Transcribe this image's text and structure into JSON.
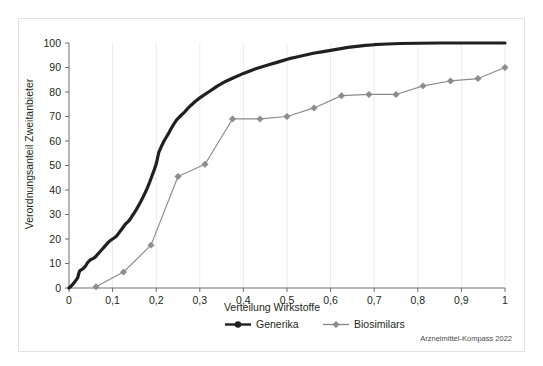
{
  "chart_data": {
    "type": "line",
    "title": "",
    "xlabel": "Verteilung Wirkstoffe",
    "ylabel": "Verordnungsanteil Zweitanbieter",
    "xlim": [
      0,
      1
    ],
    "ylim": [
      0,
      100
    ],
    "grid": true,
    "legend_position": "bottom",
    "credit": "Arzneimittel-Kompass 2022",
    "x_tick_labels": [
      "0",
      "0,1",
      "0,2",
      "0,3",
      "0,4",
      "0,5",
      "0,6",
      "0,7",
      "0,8",
      "0,9",
      "1"
    ],
    "x_tick_values": [
      0,
      0.1,
      0.2,
      0.3,
      0.4,
      0.5,
      0.6,
      0.7,
      0.8,
      0.9,
      1
    ],
    "y_tick_labels": [
      "0",
      "10",
      "20",
      "30",
      "40",
      "50",
      "60",
      "70",
      "80",
      "90",
      "100"
    ],
    "y_tick_values": [
      0,
      10,
      20,
      30,
      40,
      50,
      60,
      70,
      80,
      90,
      100
    ],
    "series": [
      {
        "name": "Generika",
        "color": "#231f20",
        "marker": "circle",
        "show_markers": false,
        "points": [
          [
            0.0,
            0.0
          ],
          [
            0.004,
            0.6
          ],
          [
            0.008,
            1.4
          ],
          [
            0.012,
            2.2
          ],
          [
            0.016,
            3.2
          ],
          [
            0.02,
            4.2
          ],
          [
            0.022,
            5.6
          ],
          [
            0.024,
            6.8
          ],
          [
            0.026,
            7.2
          ],
          [
            0.03,
            7.6
          ],
          [
            0.034,
            8.2
          ],
          [
            0.038,
            9.0
          ],
          [
            0.042,
            10.2
          ],
          [
            0.046,
            11.0
          ],
          [
            0.05,
            11.6
          ],
          [
            0.055,
            12.0
          ],
          [
            0.06,
            12.6
          ],
          [
            0.065,
            13.6
          ],
          [
            0.07,
            14.6
          ],
          [
            0.075,
            15.6
          ],
          [
            0.08,
            16.6
          ],
          [
            0.085,
            17.6
          ],
          [
            0.09,
            18.6
          ],
          [
            0.095,
            19.4
          ],
          [
            0.1,
            20.0
          ],
          [
            0.105,
            20.6
          ],
          [
            0.11,
            21.4
          ],
          [
            0.115,
            22.6
          ],
          [
            0.12,
            23.8
          ],
          [
            0.125,
            25.0
          ],
          [
            0.13,
            26.2
          ],
          [
            0.135,
            27.0
          ],
          [
            0.14,
            28.0
          ],
          [
            0.145,
            29.4
          ],
          [
            0.15,
            30.8
          ],
          [
            0.155,
            32.2
          ],
          [
            0.16,
            33.8
          ],
          [
            0.165,
            35.4
          ],
          [
            0.17,
            37.2
          ],
          [
            0.175,
            39.0
          ],
          [
            0.18,
            41.0
          ],
          [
            0.185,
            43.2
          ],
          [
            0.19,
            45.6
          ],
          [
            0.195,
            48.0
          ],
          [
            0.2,
            50.6
          ],
          [
            0.203,
            53.0
          ],
          [
            0.206,
            55.4
          ],
          [
            0.21,
            57.0
          ],
          [
            0.214,
            58.6
          ],
          [
            0.218,
            60.0
          ],
          [
            0.222,
            61.2
          ],
          [
            0.228,
            63.0
          ],
          [
            0.234,
            65.0
          ],
          [
            0.24,
            66.8
          ],
          [
            0.246,
            68.4
          ],
          [
            0.252,
            69.6
          ],
          [
            0.258,
            70.6
          ],
          [
            0.265,
            71.8
          ],
          [
            0.272,
            73.2
          ],
          [
            0.28,
            74.6
          ],
          [
            0.29,
            76.2
          ],
          [
            0.3,
            77.6
          ],
          [
            0.31,
            78.8
          ],
          [
            0.32,
            80.0
          ],
          [
            0.33,
            81.2
          ],
          [
            0.34,
            82.4
          ],
          [
            0.35,
            83.4
          ],
          [
            0.36,
            84.4
          ],
          [
            0.37,
            85.2
          ],
          [
            0.38,
            86.0
          ],
          [
            0.39,
            86.8
          ],
          [
            0.4,
            87.6
          ],
          [
            0.415,
            88.6
          ],
          [
            0.43,
            89.6
          ],
          [
            0.445,
            90.4
          ],
          [
            0.46,
            91.2
          ],
          [
            0.475,
            92.0
          ],
          [
            0.49,
            92.8
          ],
          [
            0.505,
            93.6
          ],
          [
            0.52,
            94.2
          ],
          [
            0.54,
            95.0
          ],
          [
            0.56,
            95.8
          ],
          [
            0.58,
            96.4
          ],
          [
            0.6,
            97.0
          ],
          [
            0.62,
            97.6
          ],
          [
            0.64,
            98.2
          ],
          [
            0.66,
            98.6
          ],
          [
            0.68,
            99.0
          ],
          [
            0.7,
            99.3
          ],
          [
            0.73,
            99.6
          ],
          [
            0.76,
            99.8
          ],
          [
            0.8,
            99.9
          ],
          [
            0.85,
            100.0
          ],
          [
            0.9,
            100.0
          ],
          [
            0.95,
            100.0
          ],
          [
            1.0,
            100.0
          ]
        ]
      },
      {
        "name": "Biosimilars",
        "color": "#8c8c8c",
        "marker": "diamond",
        "show_markers": true,
        "points": [
          [
            0.062,
            0.5
          ],
          [
            0.125,
            6.5
          ],
          [
            0.188,
            17.5
          ],
          [
            0.25,
            45.5
          ],
          [
            0.312,
            50.5
          ],
          [
            0.375,
            69.0
          ],
          [
            0.438,
            69.0
          ],
          [
            0.5,
            70.0
          ],
          [
            0.562,
            73.5
          ],
          [
            0.625,
            78.5
          ],
          [
            0.688,
            79.0
          ],
          [
            0.75,
            79.0
          ],
          [
            0.812,
            82.5
          ],
          [
            0.875,
            84.5
          ],
          [
            0.938,
            85.5
          ],
          [
            1.0,
            90.0
          ]
        ]
      }
    ]
  },
  "legend": {
    "items": [
      {
        "label": "Generika",
        "color": "#231f20",
        "marker": "circle"
      },
      {
        "label": "Biosimilars",
        "color": "#8c8c8c",
        "marker": "diamond"
      }
    ]
  }
}
